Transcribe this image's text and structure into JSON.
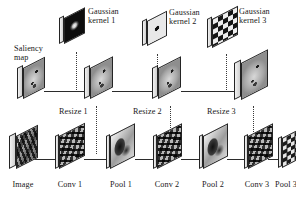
{
  "figure": {
    "type": "diagram",
    "title_visible": false
  },
  "colors": {
    "background": "#ffffff",
    "slab_outline": "#242424",
    "slab_face": "#b9b9b9",
    "connector_line": "#2b2b2b",
    "dotted_connector": "#3a3a3a",
    "text": "#181818"
  },
  "labels": {
    "saliency_map": "Saliency\nmap",
    "gaussian_kernel_1": "Gaussian\nkernel 1",
    "gaussian_kernel_2": "Gaussian\nkernel 2",
    "gaussian_kernel_3": "Gaussian\nkernel 3",
    "resize_1": "Resize 1",
    "resize_2": "Resize 2",
    "resize_3": "Resize 3",
    "image": "Image",
    "conv_1": "Conv 1",
    "pool_1": "Pool 1",
    "conv_2": "Conv 2",
    "pool_2": "Pool 2",
    "conv_3": "Conv 3",
    "pool_3": "Pool 3"
  },
  "rows": {
    "kernel_row": {
      "name": "gaussian-kernel-row",
      "items": [
        {
          "id": "gaussian-kernel-1",
          "label": "Gaussian\nkernel 1",
          "texture": "blurred-bright-blob-on-dark"
        },
        {
          "id": "gaussian-kernel-2",
          "label": "Gaussian\nkernel 2",
          "texture": "dark-square-on-light"
        },
        {
          "id": "gaussian-kernel-3",
          "label": "Gaussian\nkernel 3",
          "texture": "checkerboard"
        }
      ]
    },
    "saliency_row": {
      "name": "saliency-map-row",
      "items": [
        {
          "id": "saliency-map-0",
          "label": "Saliency\nmap",
          "texture": "saliency-blobs"
        },
        {
          "id": "saliency-map-1",
          "label": "",
          "texture": "saliency-blobs"
        },
        {
          "id": "saliency-map-2",
          "label": "",
          "texture": "saliency-blobs"
        },
        {
          "id": "saliency-map-3",
          "label": "",
          "texture": "saliency-blobs"
        }
      ]
    },
    "feature_row": {
      "name": "feature-map-row",
      "items": [
        {
          "id": "image",
          "label": "Image",
          "texture": "photo-natural-image"
        },
        {
          "id": "conv-1",
          "label": "Conv 1",
          "texture": "high-frequency-filter-response"
        },
        {
          "id": "pool-1",
          "label": "Pool 1",
          "texture": "smoothed-blobs"
        },
        {
          "id": "conv-2",
          "label": "Conv 2",
          "texture": "high-frequency-filter-response"
        },
        {
          "id": "pool-2",
          "label": "Pool 2",
          "texture": "smoothed-blobs"
        },
        {
          "id": "conv-3",
          "label": "Conv 3",
          "texture": "high-frequency-filter-response"
        },
        {
          "id": "pool-3",
          "label": "Pool 3",
          "texture": "coarse-blocky"
        }
      ]
    }
  },
  "operations": {
    "resize": [
      {
        "id": "resize-1",
        "label": "Resize 1"
      },
      {
        "id": "resize-2",
        "label": "Resize 2"
      },
      {
        "id": "resize-3",
        "label": "Resize 3"
      }
    ]
  }
}
